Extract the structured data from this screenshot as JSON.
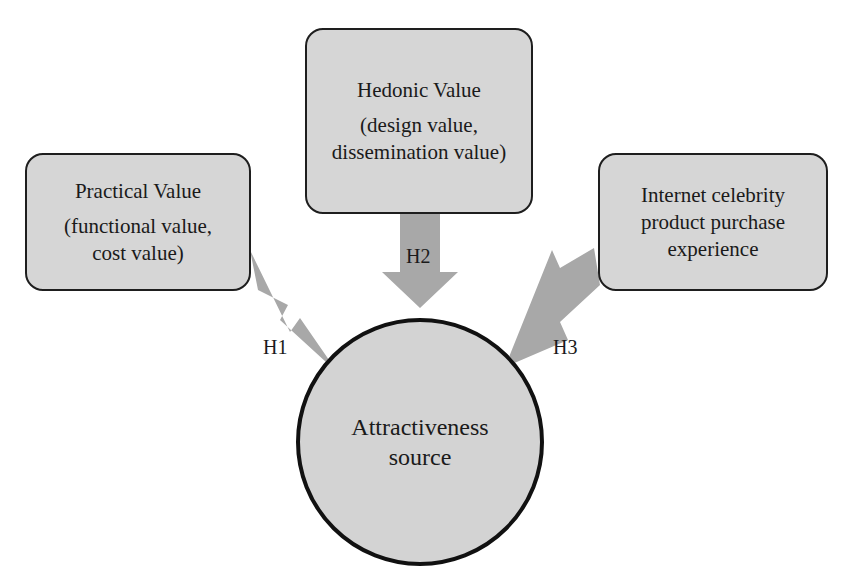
{
  "diagram": {
    "nodes": {
      "practical": {
        "title": "Practical Value",
        "line2": "(functional value,",
        "line3": "cost value)"
      },
      "hedonic": {
        "title": "Hedonic Value",
        "line2": "(design value,",
        "line3": "dissemination value)"
      },
      "experience": {
        "title": "Internet celebrity",
        "line2": "product purchase",
        "line3": "experience"
      },
      "attractiveness": {
        "line1": "Attractiveness",
        "line2": "source"
      }
    },
    "edges": [
      {
        "id": "H1",
        "label": "H1",
        "from": "practical",
        "to": "attractiveness"
      },
      {
        "id": "H2",
        "label": "H2",
        "from": "hedonic",
        "to": "attractiveness"
      },
      {
        "id": "H3",
        "label": "H3",
        "from": "experience",
        "to": "attractiveness"
      }
    ],
    "colors": {
      "box_fill": "#d6d6d6",
      "circle_fill": "#d3d3d3",
      "arrow_fill": "#a8a8a8",
      "stroke": "#1e1e1e"
    }
  }
}
